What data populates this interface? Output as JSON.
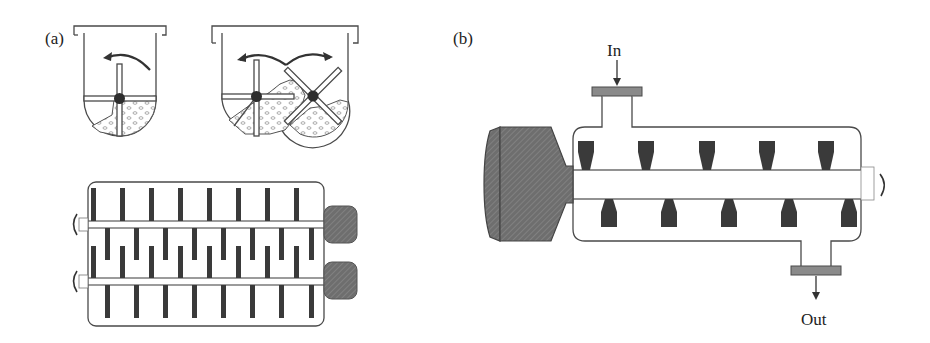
{
  "panels": {
    "a": {
      "label": "(a)",
      "top_left": "single-shaft paddle mixer cross-section",
      "top_right": "twin-shaft paddle mixer cross-section",
      "bottom": "twin-shaft paddle mixer top view",
      "paddles_per_row_top": 8,
      "paddles_per_row_middle": 17,
      "paddles_per_row_bottom": 8
    },
    "b": {
      "label": "(b)",
      "inlet_label": "In",
      "outlet_label": "Out",
      "top_paddles": 5,
      "bottom_paddles": 5
    }
  },
  "colors": {
    "line": "#4a4a4a",
    "paddle": "#3a3a3a",
    "motor": "#6b6b6b",
    "flange": "#8a8a8a",
    "background": "#ffffff"
  }
}
